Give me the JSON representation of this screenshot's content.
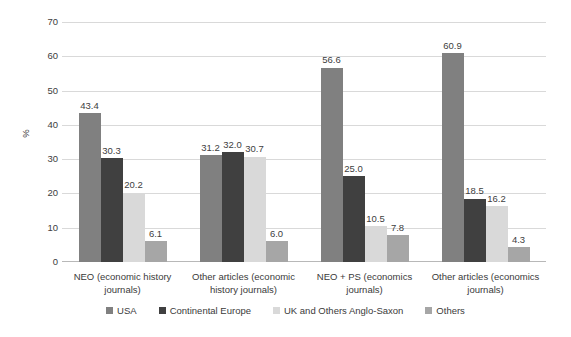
{
  "chart_data": {
    "type": "bar",
    "title": "",
    "xlabel": "",
    "ylabel": "%",
    "ylim": [
      0,
      70
    ],
    "ytick_step": 10,
    "yticks": [
      "70",
      "60",
      "50",
      "40",
      "30",
      "20",
      "10",
      "0"
    ],
    "grid": true,
    "legend_position": "bottom",
    "categories": [
      "NEO (economic history journals)",
      "Other articles (economic history journals)",
      "NEO + PS (economics journals)",
      "Other articles (economics journals)"
    ],
    "series": [
      {
        "name": "USA",
        "color": "#808080",
        "values": [
          43.4,
          31.2,
          56.6,
          60.9
        ],
        "labels": [
          "43.4",
          "31.2",
          "56.6",
          "60.9"
        ]
      },
      {
        "name": "Continental Europe",
        "color": "#404040",
        "values": [
          30.3,
          32.0,
          25.0,
          18.5
        ],
        "labels": [
          "30.3",
          "32.0",
          "25.0",
          "18.5"
        ]
      },
      {
        "name": "UK and Others Anglo-Saxon",
        "color": "#d9d9d9",
        "values": [
          20.2,
          30.7,
          10.5,
          16.2
        ],
        "labels": [
          "20.2",
          "30.7",
          "10.5",
          "16.2"
        ]
      },
      {
        "name": "Others",
        "color": "#a6a6a6",
        "values": [
          6.1,
          6.0,
          7.8,
          4.3
        ],
        "labels": [
          "6.1",
          "6.0",
          "7.8",
          "4.3"
        ]
      }
    ]
  },
  "axis": {
    "y_title": "%",
    "ticks": [
      "70",
      "60",
      "50",
      "40",
      "30",
      "20",
      "10",
      "0"
    ]
  },
  "legend": {
    "items": [
      {
        "label": "USA",
        "color": "#808080"
      },
      {
        "label": "Continental Europe",
        "color": "#404040"
      },
      {
        "label": "UK and Others Anglo-Saxon",
        "color": "#d9d9d9"
      },
      {
        "label": "Others",
        "color": "#a6a6a6"
      }
    ]
  },
  "colors": {
    "gridline": "#d9d9d9",
    "axis": "#b8b8b8",
    "text": "#3a3a3a",
    "background": "#ffffff"
  }
}
